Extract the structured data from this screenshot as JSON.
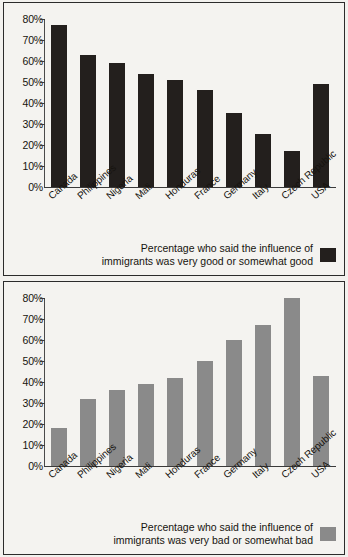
{
  "chart_data": [
    {
      "type": "bar",
      "id": "good",
      "title": "",
      "xlabel": "",
      "ylabel": "",
      "categories": [
        "Canada",
        "Philippines",
        "Nigeria",
        "Mali",
        "Honduras",
        "France",
        "Germany",
        "Italy",
        "Czech Republic",
        "USA"
      ],
      "values": [
        77,
        63,
        59,
        54,
        51,
        46,
        35,
        25,
        17,
        49
      ],
      "ylim": [
        0,
        80
      ],
      "ytick_labels": [
        "80%",
        "70%",
        "60%",
        "50%",
        "40%",
        "30%",
        "20%",
        "10%",
        "0%"
      ],
      "ytick_values": [
        80,
        70,
        60,
        50,
        40,
        30,
        20,
        10,
        0
      ],
      "grid": false,
      "legend_position": "bottom-right",
      "legend": [
        {
          "label": "Percentage who said the influence of\nimmigrants was very good or somewhat good",
          "color": "#231f1d"
        }
      ],
      "bar_color": "#231f1d"
    },
    {
      "type": "bar",
      "id": "bad",
      "title": "",
      "xlabel": "",
      "ylabel": "",
      "categories": [
        "Canada",
        "Philippines",
        "Nigeria",
        "Mali",
        "Honduras",
        "France",
        "Germany",
        "Italy",
        "Czech Republic",
        "USA"
      ],
      "values": [
        18,
        32,
        36,
        39,
        42,
        50,
        60,
        67,
        80,
        43
      ],
      "ylim": [
        0,
        80
      ],
      "ytick_labels": [
        "80%",
        "70%",
        "60%",
        "50%",
        "40%",
        "30%",
        "20%",
        "10%",
        "0%"
      ],
      "ytick_values": [
        80,
        70,
        60,
        50,
        40,
        30,
        20,
        10,
        0
      ],
      "grid": false,
      "legend_position": "bottom-right",
      "legend": [
        {
          "label": "Percentage who said the influence of\nimmigrants was very bad or somewhat bad",
          "color": "#8a8a8a"
        }
      ],
      "bar_color": "#8a8a8a"
    }
  ],
  "colors": {
    "page_background": "#f2f1ee",
    "panel_background": "#f4f3f0",
    "panel_border": "#2b2b2b",
    "axis": "#3a3a3a",
    "text": "#16130f",
    "bar_good": "#231f1d",
    "bar_bad": "#8a8a8a"
  }
}
